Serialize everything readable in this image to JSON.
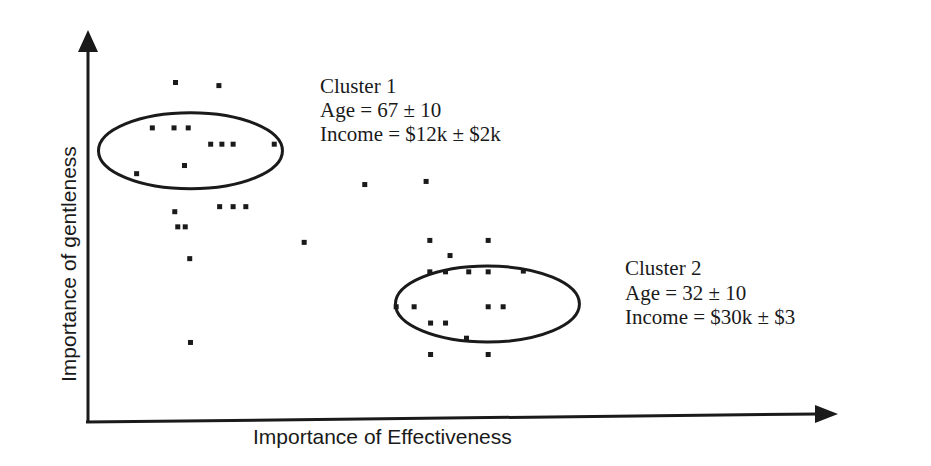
{
  "chart_data": {
    "type": "scatter",
    "title": "",
    "xlabel": "Importance of Effectiveness",
    "ylabel": "Importance of gentleness",
    "xlim": [
      0,
      100
    ],
    "ylim": [
      0,
      100
    ],
    "grid": false,
    "ticks": "none",
    "clusters": [
      {
        "name": "Cluster 1",
        "label_lines": [
          "Cluster  1",
          "Age  =  67  ±  10",
          "Income  =  $12k  ±  $2k"
        ],
        "center": [
          13.7,
          69.9
        ],
        "radius": [
          24.6,
          19.6
        ],
        "points": [
          [
            11.7,
            87.5
          ],
          [
            17.5,
            86.7
          ],
          [
            8.6,
            75.8
          ],
          [
            11.5,
            75.8
          ],
          [
            13.4,
            75.8
          ],
          [
            16.4,
            71.6
          ],
          [
            17.9,
            71.6
          ],
          [
            19.4,
            71.6
          ],
          [
            24.9,
            71.6
          ],
          [
            6.5,
            64.0
          ],
          [
            12.9,
            66.1
          ],
          [
            11.6,
            54.2
          ],
          [
            17.6,
            55.5
          ],
          [
            19.4,
            55.5
          ],
          [
            21.1,
            55.5
          ],
          [
            12.0,
            50.3
          ],
          [
            13.0,
            50.3
          ]
        ]
      },
      {
        "name": "Cluster 2",
        "label_lines": [
          "Cluster  2",
          "Age  =  32  ±  10",
          "Income  =  $30k  ±  $3"
        ],
        "center": [
          53.4,
          30.4
        ],
        "radius": [
          24.6,
          19.6
        ],
        "points": [
          [
            45.7,
            46.8
          ],
          [
            53.5,
            46.8
          ],
          [
            48.4,
            42.9
          ],
          [
            45.7,
            38.7
          ],
          [
            47.8,
            38.7
          ],
          [
            50.9,
            38.7
          ],
          [
            53.5,
            38.7
          ],
          [
            58.2,
            38.9
          ],
          [
            41.2,
            29.7
          ],
          [
            43.6,
            29.7
          ],
          [
            53.5,
            29.7
          ],
          [
            55.5,
            29.7
          ],
          [
            45.8,
            25.5
          ],
          [
            47.8,
            25.5
          ],
          [
            50.6,
            21.6
          ],
          [
            45.8,
            17.4
          ],
          [
            53.5,
            17.4
          ]
        ]
      }
    ],
    "outliers": [
      [
        28.9,
        46.3
      ],
      [
        45.2,
        62.0
      ],
      [
        13.6,
        42.1
      ],
      [
        13.7,
        20.5
      ],
      [
        37.0,
        61.2
      ]
    ]
  }
}
